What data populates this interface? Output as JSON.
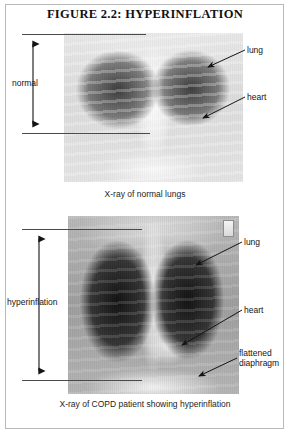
{
  "figure": {
    "title": "FIGURE 2.2: HYPERINFLATION"
  },
  "panels": {
    "normal": {
      "caption": "X-ray of normal lungs",
      "dimension_label": "normal",
      "labels": {
        "lung": "lung",
        "heart": "heart"
      }
    },
    "copd": {
      "caption": "X-ray of COPD patient showing hyperinflation",
      "dimension_label": "hyperinflation",
      "labels": {
        "lung": "lung",
        "heart": "heart",
        "diaphragm": "flattened diaphragm"
      }
    }
  },
  "colors": {
    "frame_border": "#b9b9b9",
    "text": "#141414",
    "leader_line": "#1b1b1b",
    "page_background": "#ffffff"
  }
}
